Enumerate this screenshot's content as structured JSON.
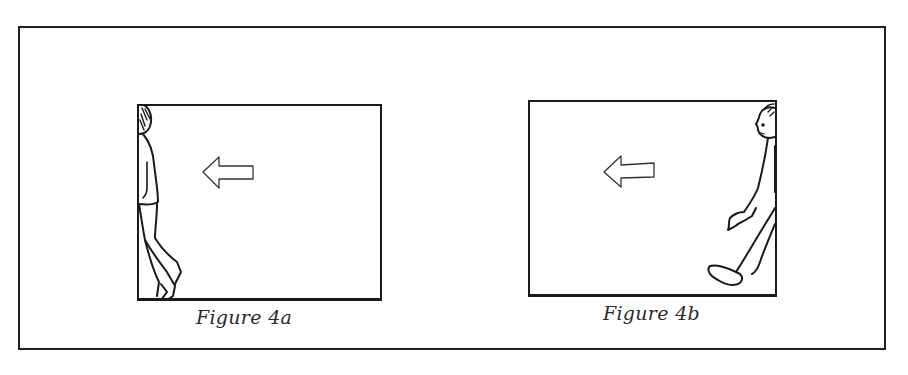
{
  "figure": {
    "panels": [
      {
        "id": "4a",
        "caption": "Figure 4a",
        "arrow_direction": "left",
        "person_position": "exiting left edge",
        "person_facing": "away"
      },
      {
        "id": "4b",
        "caption": "Figure 4b",
        "arrow_direction": "left",
        "person_position": "entering from right edge",
        "person_facing": "left"
      }
    ]
  },
  "colors": {
    "ink": "#1a1a1a",
    "background": "#ffffff"
  }
}
